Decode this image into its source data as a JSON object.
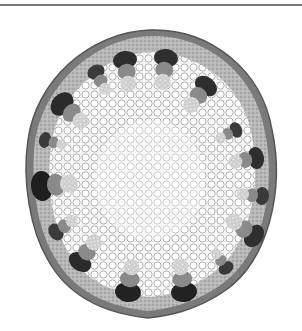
{
  "image": {
    "subject": "plant stem cross-section micrograph",
    "style": "grayscale",
    "colors": {
      "background": "#ffffff",
      "epidermis": "#6e6e6e",
      "cortex": "#b4b4b4",
      "bundle_cap": "#2e2e2e",
      "phloem": "#8a8a8a",
      "pith": "#f4f4f4",
      "cell_wall": "#9a9a9a",
      "top_rule": "#7a7a7a"
    },
    "vascular_bundle_count": 16
  }
}
